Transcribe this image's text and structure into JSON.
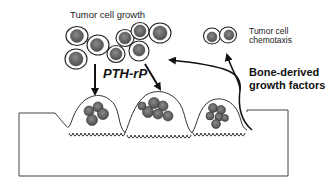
{
  "diagram": {
    "title": "Tumor cell growth",
    "labels": {
      "tumor_growth": "Tumor cell growth",
      "chemotaxis_line1": "Tumor cell",
      "chemotaxis_line2": "chemotaxis",
      "pthrp": "PTH-rP",
      "bone_factors_line1": "Bone-derived",
      "bone_factors_line2": "growth factors"
    },
    "nodes": [
      {
        "id": "tumor-cell-cluster",
        "label": "Tumor cell growth",
        "type": "cell-group",
        "count": 9
      },
      {
        "id": "chemotaxis-cells",
        "label": "Tumor cell chemotaxis",
        "type": "cell-group",
        "count": 2
      },
      {
        "id": "osteoclasts",
        "label": "Osteoclasts on bone surface",
        "type": "cell-group",
        "count": 3
      },
      {
        "id": "bone",
        "label": "Bone matrix",
        "type": "region"
      }
    ],
    "edges": [
      {
        "from": "tumor-cell-cluster",
        "to": "osteoclasts",
        "label": "PTH-rP"
      },
      {
        "from": "bone",
        "to": "tumor-cell-cluster",
        "label": "Bone-derived growth factors"
      },
      {
        "from": "bone",
        "to": "chemotaxis-cells",
        "label": "Bone-derived growth factors"
      }
    ],
    "colors": {
      "stroke": "#222222",
      "nucleus": "#6e6e6e",
      "nucleus_dark": "#555555",
      "background": "#ffffff"
    }
  }
}
